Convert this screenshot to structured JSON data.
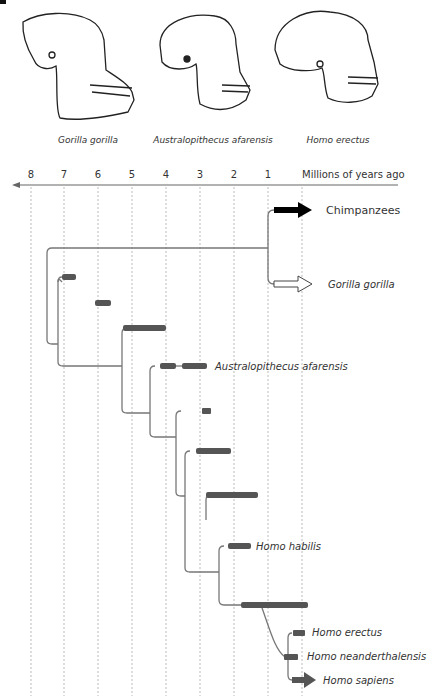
{
  "skulls": [
    {
      "name": "Gorilla gorilla"
    },
    {
      "name": "Australopithecus afarensis"
    },
    {
      "name": "Homo erectus"
    }
  ],
  "axis": {
    "title": "Millions of years ago",
    "ticks": [
      "8",
      "7",
      "6",
      "5",
      "4",
      "3",
      "2",
      "1"
    ]
  },
  "species": {
    "chimp": "Chimpanzees",
    "gorilla": "Gorilla gorilla",
    "australopithecus": "Australopithecus afarensis",
    "habilis": "Homo habilis",
    "erectus": "Homo erectus",
    "neanderthal": "Homo neanderthalensis",
    "sapiens": "Homo sapiens"
  },
  "colors": {
    "bar": "#555555",
    "line": "#777777",
    "grid": "#aaaaaa",
    "chimp_arrow": "#000000"
  }
}
